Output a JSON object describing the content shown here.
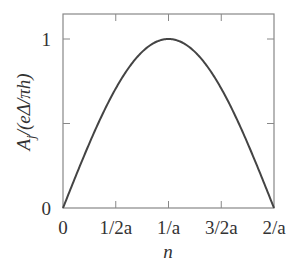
{
  "chart_data": {
    "type": "line",
    "title": "",
    "xlabel": "n",
    "ylabel": "A_j/(eΔ/πh)",
    "ylabel_parts": {
      "main": "A",
      "sub": "j",
      "rest": "/(eΔ/πh)"
    },
    "xlim": [
      0,
      2
    ],
    "ylim": [
      0,
      1.15
    ],
    "x_ticks": [
      0,
      0.5,
      1,
      1.5,
      2
    ],
    "x_tick_labels": [
      "0",
      "1/2a",
      "1/a",
      "3/2a",
      "2/a"
    ],
    "y_ticks": [
      0,
      0.5,
      1
    ],
    "y_tick_labels": [
      "0",
      "",
      "1"
    ],
    "grid": false,
    "legend": null,
    "series": [
      {
        "name": "A_j",
        "description": "sin(pi*n*a/2) shaped arch from 0 to 2/a, peak 1 at 1/a",
        "x": [
          0,
          0.125,
          0.25,
          0.375,
          0.5,
          0.625,
          0.75,
          0.875,
          1,
          1.125,
          1.25,
          1.375,
          1.5,
          1.625,
          1.75,
          1.875,
          2
        ],
        "values": [
          0,
          0.195,
          0.383,
          0.556,
          0.707,
          0.831,
          0.924,
          0.981,
          1,
          0.981,
          0.924,
          0.831,
          0.707,
          0.556,
          0.383,
          0.195,
          0
        ],
        "color": "#444444"
      }
    ]
  }
}
